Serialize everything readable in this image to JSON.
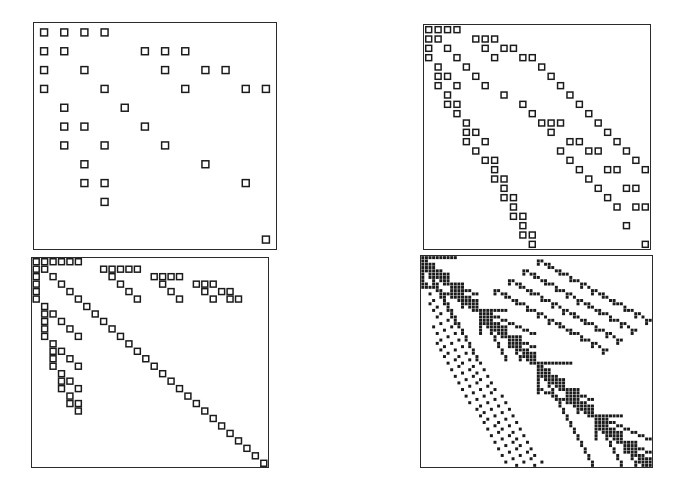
{
  "figure": {
    "title": "",
    "background_color": "#ffffff",
    "width": 679,
    "height": 496,
    "layout": "2x2 grid of sparsity (spy) plots",
    "panel_border_color": "#2b2b2b",
    "marker_open_fill": "#ffffff",
    "marker_stroke_color": "#1b1b1b",
    "marker_filled_color": "#1b1b1b"
  },
  "panels": [
    {
      "name": "panel-top-left",
      "label": "",
      "grid_size": 12,
      "marker_style": "open-square",
      "marker_px": 7,
      "rect": {
        "x": 33,
        "y": 22,
        "w": 244,
        "h": 228
      },
      "nnz": 34,
      "points": [
        [
          0,
          0
        ],
        [
          0,
          1
        ],
        [
          0,
          2
        ],
        [
          0,
          3
        ],
        [
          1,
          0
        ],
        [
          1,
          1
        ],
        [
          1,
          5
        ],
        [
          1,
          6
        ],
        [
          1,
          7
        ],
        [
          2,
          0
        ],
        [
          2,
          2
        ],
        [
          2,
          6
        ],
        [
          2,
          8
        ],
        [
          2,
          9
        ],
        [
          3,
          0
        ],
        [
          3,
          3
        ],
        [
          3,
          7
        ],
        [
          3,
          10
        ],
        [
          3,
          11
        ],
        [
          4,
          1
        ],
        [
          4,
          4
        ],
        [
          5,
          1
        ],
        [
          5,
          2
        ],
        [
          5,
          5
        ],
        [
          6,
          1
        ],
        [
          6,
          3
        ],
        [
          6,
          6
        ],
        [
          7,
          2
        ],
        [
          7,
          8
        ],
        [
          8,
          2
        ],
        [
          8,
          3
        ],
        [
          8,
          10
        ],
        [
          9,
          3
        ],
        [
          11,
          11
        ]
      ]
    },
    {
      "name": "panel-top-right",
      "label": "",
      "grid_size": 24,
      "marker_style": "open-square",
      "marker_px": 6,
      "rect": {
        "x": 423,
        "y": 24,
        "w": 228,
        "h": 226
      },
      "nnz": 96,
      "points": [
        [
          0,
          0
        ],
        [
          0,
          1
        ],
        [
          0,
          2
        ],
        [
          0,
          3
        ],
        [
          1,
          0
        ],
        [
          1,
          1
        ],
        [
          1,
          5
        ],
        [
          1,
          6
        ],
        [
          1,
          7
        ],
        [
          2,
          0
        ],
        [
          2,
          2
        ],
        [
          2,
          6
        ],
        [
          2,
          8
        ],
        [
          2,
          9
        ],
        [
          3,
          0
        ],
        [
          3,
          3
        ],
        [
          3,
          7
        ],
        [
          3,
          10
        ],
        [
          3,
          11
        ],
        [
          4,
          1
        ],
        [
          4,
          4
        ],
        [
          5,
          1
        ],
        [
          5,
          2
        ],
        [
          5,
          5
        ],
        [
          6,
          1
        ],
        [
          6,
          3
        ],
        [
          6,
          6
        ],
        [
          7,
          2
        ],
        [
          7,
          8
        ],
        [
          8,
          2
        ],
        [
          8,
          3
        ],
        [
          8,
          10
        ],
        [
          9,
          3
        ],
        [
          9,
          11
        ],
        [
          10,
          4
        ],
        [
          10,
          12
        ],
        [
          10,
          13
        ],
        [
          10,
          14
        ],
        [
          11,
          4
        ],
        [
          11,
          5
        ],
        [
          11,
          13
        ],
        [
          12,
          4
        ],
        [
          12,
          6
        ],
        [
          12,
          15
        ],
        [
          12,
          16
        ],
        [
          13,
          5
        ],
        [
          13,
          14
        ],
        [
          13,
          17
        ],
        [
          13,
          18
        ],
        [
          14,
          6
        ],
        [
          14,
          7
        ],
        [
          14,
          15
        ],
        [
          15,
          7
        ],
        [
          15,
          16
        ],
        [
          15,
          19
        ],
        [
          15,
          20
        ],
        [
          16,
          7
        ],
        [
          16,
          8
        ],
        [
          16,
          17
        ],
        [
          17,
          8
        ],
        [
          17,
          18
        ],
        [
          17,
          21
        ],
        [
          17,
          22
        ],
        [
          18,
          8
        ],
        [
          18,
          9
        ],
        [
          18,
          19
        ],
        [
          19,
          9
        ],
        [
          19,
          20
        ],
        [
          19,
          22
        ],
        [
          19,
          23
        ],
        [
          20,
          9
        ],
        [
          20,
          10
        ],
        [
          21,
          10
        ],
        [
          21,
          21
        ],
        [
          22,
          10
        ],
        [
          22,
          11
        ],
        [
          23,
          11
        ],
        [
          23,
          23
        ],
        [
          4,
          12
        ],
        [
          5,
          13
        ],
        [
          6,
          14
        ],
        [
          7,
          15
        ],
        [
          8,
          16
        ],
        [
          9,
          17
        ],
        [
          10,
          18
        ],
        [
          11,
          19
        ],
        [
          12,
          20
        ],
        [
          13,
          21
        ],
        [
          14,
          22
        ],
        [
          15,
          23
        ]
      ]
    },
    {
      "name": "panel-bottom-left",
      "label": "",
      "grid_size": 28,
      "marker_style": "open-square",
      "marker_px": 6,
      "rect": {
        "x": 31,
        "y": 257,
        "w": 238,
        "h": 211
      },
      "nnz": 104,
      "points": [
        [
          0,
          0
        ],
        [
          0,
          1
        ],
        [
          0,
          2
        ],
        [
          0,
          3
        ],
        [
          0,
          4
        ],
        [
          0,
          5
        ],
        [
          1,
          0
        ],
        [
          1,
          1
        ],
        [
          1,
          8
        ],
        [
          1,
          9
        ],
        [
          1,
          10
        ],
        [
          1,
          11
        ],
        [
          1,
          12
        ],
        [
          2,
          0
        ],
        [
          2,
          2
        ],
        [
          2,
          9
        ],
        [
          2,
          14
        ],
        [
          2,
          15
        ],
        [
          2,
          16
        ],
        [
          2,
          17
        ],
        [
          3,
          0
        ],
        [
          3,
          3
        ],
        [
          3,
          10
        ],
        [
          3,
          15
        ],
        [
          3,
          19
        ],
        [
          3,
          20
        ],
        [
          3,
          21
        ],
        [
          4,
          0
        ],
        [
          4,
          4
        ],
        [
          4,
          11
        ],
        [
          4,
          16
        ],
        [
          4,
          20
        ],
        [
          4,
          22
        ],
        [
          4,
          23
        ],
        [
          5,
          0
        ],
        [
          5,
          5
        ],
        [
          5,
          12
        ],
        [
          5,
          17
        ],
        [
          5,
          21
        ],
        [
          5,
          23
        ],
        [
          5,
          24
        ],
        [
          6,
          1
        ],
        [
          6,
          6
        ],
        [
          7,
          1
        ],
        [
          7,
          2
        ],
        [
          7,
          7
        ],
        [
          8,
          1
        ],
        [
          8,
          3
        ],
        [
          8,
          8
        ],
        [
          9,
          1
        ],
        [
          9,
          4
        ],
        [
          9,
          9
        ],
        [
          10,
          1
        ],
        [
          10,
          5
        ],
        [
          10,
          10
        ],
        [
          11,
          2
        ],
        [
          11,
          11
        ],
        [
          12,
          2
        ],
        [
          12,
          3
        ],
        [
          12,
          12
        ],
        [
          13,
          2
        ],
        [
          13,
          4
        ],
        [
          13,
          13
        ],
        [
          14,
          2
        ],
        [
          14,
          5
        ],
        [
          14,
          14
        ],
        [
          15,
          3
        ],
        [
          15,
          15
        ],
        [
          16,
          3
        ],
        [
          16,
          4
        ],
        [
          16,
          16
        ],
        [
          17,
          3
        ],
        [
          17,
          5
        ],
        [
          17,
          17
        ],
        [
          18,
          4
        ],
        [
          18,
          18
        ],
        [
          19,
          4
        ],
        [
          19,
          5
        ],
        [
          19,
          19
        ],
        [
          20,
          5
        ],
        [
          20,
          20
        ],
        [
          21,
          21
        ],
        [
          22,
          22
        ],
        [
          23,
          23
        ],
        [
          24,
          24
        ],
        [
          25,
          25
        ],
        [
          26,
          26
        ],
        [
          27,
          27
        ]
      ]
    },
    {
      "name": "panel-bottom-right",
      "label": "",
      "grid_size": 64,
      "marker_style": "filled-square",
      "marker_px": 3,
      "rect": {
        "x": 420,
        "y": 255,
        "w": 233,
        "h": 213
      },
      "nnz": 520,
      "description": "dense recursive block pattern, lower-triangular with nested diagonal bands"
    }
  ]
}
